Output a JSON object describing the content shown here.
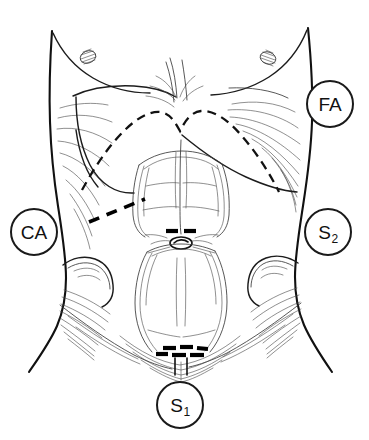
{
  "figure": {
    "caption": "",
    "background_color": "#ffffff",
    "line_color": "#111111",
    "width": 369,
    "height": 440
  },
  "labels": [
    {
      "id": "FA",
      "text": "FA",
      "base": "FA",
      "subscript": "",
      "x": 330,
      "y": 104,
      "position": "right-upper"
    },
    {
      "id": "CA",
      "text": "CA",
      "base": "CA",
      "subscript": "",
      "x": 34,
      "y": 232,
      "position": "left-middle"
    },
    {
      "id": "S2",
      "text": "S2",
      "base": "S",
      "subscript": "2",
      "x": 328,
      "y": 232,
      "position": "right-middle"
    },
    {
      "id": "S1",
      "text": "S1",
      "base": "S",
      "subscript": "1",
      "x": 180,
      "y": 405,
      "position": "bottom-center"
    }
  ],
  "markings": {
    "costal_margin": "dashed arch with xiphoid notch",
    "ca_incision": "bold dashed oblique line, left upper quadrant",
    "s2_port": "two bold dashes above umbilicus",
    "s1_incision": "bold dashed transverse suprapubic line"
  },
  "anatomy_features": [
    "torso outline",
    "breast contour",
    "nipple left",
    "nipple right",
    "costal margin",
    "rectus abdominis upper",
    "rectus abdominis lower",
    "linea alba",
    "umbilicus",
    "iliac crest left",
    "iliac crest right",
    "inguinal fold",
    "pubic cleft"
  ]
}
